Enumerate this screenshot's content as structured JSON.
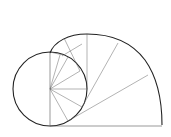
{
  "diagram": {
    "type": "involute-of-circle construction",
    "background": "#ffffff",
    "stroke_color": "#222222",
    "circle": {
      "cx": 50,
      "cy": 89,
      "r": 37
    },
    "base_line": {
      "x1": 50,
      "y1": 126,
      "x2": 162,
      "y2": 126
    },
    "outer_arc_end": {
      "x": 162,
      "y": 125
    },
    "labels": []
  }
}
